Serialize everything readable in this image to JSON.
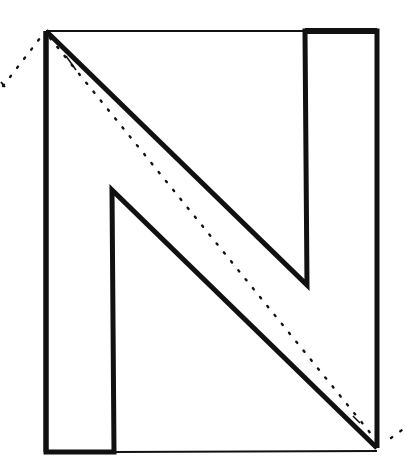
{
  "figure": {
    "stroke_color": "#111111",
    "background": "#ffffff",
    "outer_rect": {
      "x1": 46,
      "y1": 31,
      "x2": 377,
      "y2": 452
    },
    "n_shape": {
      "points": [
        [
          46,
          31
        ],
        [
          307,
          285
        ],
        [
          305,
          31
        ],
        [
          377,
          31
        ],
        [
          377,
          448
        ],
        [
          112,
          190
        ],
        [
          114,
          452
        ],
        [
          46,
          452
        ]
      ]
    },
    "notch_top_right": {
      "x1": 305,
      "y1": 30,
      "x2": 377,
      "y2": 30
    },
    "dotted_line": {
      "x1": 3,
      "y1": 86,
      "x2": 46,
      "y2": 31,
      "x3": 378,
      "y3": 444,
      "x4": 402,
      "y4": 425
    }
  }
}
